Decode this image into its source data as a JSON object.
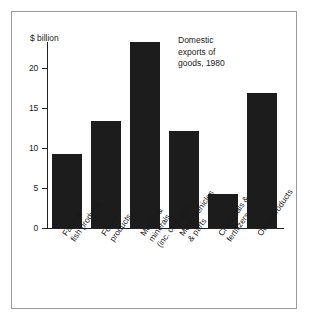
{
  "chart_data": {
    "type": "bar",
    "title": "",
    "annotation": "Domestic\nexports of\ngoods, 1980",
    "ylabel": "$ billion",
    "xlabel": "",
    "ylim": [
      0,
      23.5
    ],
    "yticks": [
      0,
      5,
      10,
      15,
      20
    ],
    "ytick_labels": [
      "0",
      "5",
      "10",
      "15",
      "20"
    ],
    "grid": false,
    "legend": null,
    "bar_color": "#1c1c1c",
    "categories": [
      "Farm &\nfish products",
      "Forest\nproducts",
      "Metals &\nminerals\n(inc. oil & gas)",
      "Motor vehicles\n& parts",
      "Chemicals &\nfertilizers",
      "Other products"
    ],
    "values": [
      9.2,
      13.4,
      23.2,
      12.1,
      4.2,
      16.9
    ]
  }
}
